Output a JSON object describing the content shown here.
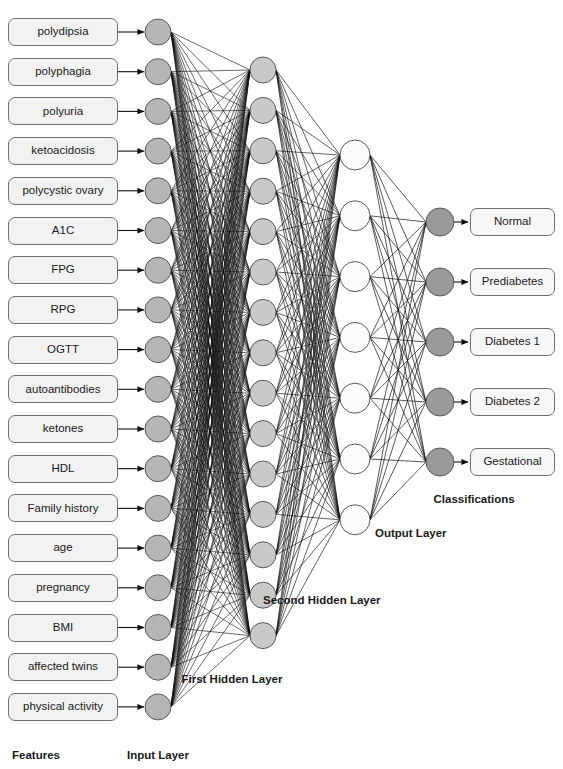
{
  "diagram": {
    "type": "neural-network-architecture",
    "title_visible": false,
    "background": "#ffffff"
  },
  "colors": {
    "input_node_fill": "#b6b6b6",
    "hidden1_node_fill": "#c9c9c9",
    "hidden2_node_fill": "#fcfcfc",
    "output_node_fill": "#9a9a9a",
    "node_stroke": "#5a5a5a",
    "edge": "#111111",
    "box_fill": "#f2f2f2",
    "box_stroke": "#6f6f6f",
    "text": "#1a1a1a"
  },
  "features": {
    "group_label": "Features",
    "items": [
      "polydipsia",
      "polyphagia",
      "polyuria",
      "ketoacidosis",
      "polycystic ovary",
      "A1C",
      "FPG",
      "RPG",
      "OGTT",
      "autoantibodies",
      "ketones",
      "HDL",
      "Family history",
      "age",
      "pregnancy",
      "BMI",
      "affected twins",
      "physical activity"
    ]
  },
  "classifications": {
    "group_label": "Classifications",
    "items": [
      "Normal",
      "Prediabetes",
      "Diabetes 1",
      "Diabetes 2",
      "Gestational"
    ]
  },
  "layers": [
    {
      "id": "input",
      "label": "Input Layer",
      "node_count": 18
    },
    {
      "id": "hidden1",
      "label": "First Hidden Layer",
      "node_count": 15
    },
    {
      "id": "hidden2",
      "label": "Second Hidden Layer",
      "node_count": 7
    },
    {
      "id": "output",
      "label": "Output Layer",
      "node_count": 5
    }
  ],
  "geometry": {
    "width": 563,
    "height": 769,
    "box_x": 8,
    "box_width": 110,
    "box_height": 28,
    "box_first_center_y": 32,
    "box_step_y": 39.7,
    "input_x": 158,
    "input_r": 13,
    "input_first_center_y": 32,
    "input_step_y": 39.7,
    "hidden1_x": 263,
    "hidden1_r": 13,
    "hidden1_first_center_y": 70,
    "hidden1_step_y": 40.4,
    "hidden2_x": 355,
    "hidden2_r": 15,
    "hidden2_first_center_y": 155,
    "hidden2_step_y": 60.8,
    "output_x": 440,
    "output_r": 14,
    "output_first_center_y": 222,
    "output_step_y": 60,
    "class_box_x": 470,
    "class_box_width": 85,
    "class_box_height": 28
  },
  "layer_label_positions": {
    "features": {
      "x": 36,
      "y": 750
    },
    "input": {
      "x": 158,
      "y": 750
    },
    "hidden1": {
      "x": 232,
      "y": 674
    },
    "hidden2": {
      "x": 322,
      "y": 595
    },
    "output": {
      "x": 411,
      "y": 528
    },
    "classifications": {
      "x": 474,
      "y": 494
    }
  }
}
